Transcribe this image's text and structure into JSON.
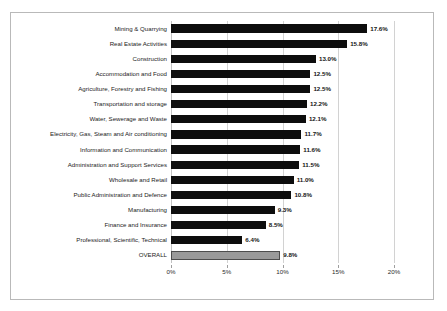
{
  "chart_data": {
    "type": "bar",
    "orientation": "horizontal",
    "title": "",
    "subtitle": "",
    "xlabel": "",
    "ylabel": "",
    "xlim": [
      0,
      20
    ],
    "xtick_labels": [
      "0%",
      "5%",
      "10%",
      "15%",
      "20%"
    ],
    "xticks": [
      0,
      5,
      10,
      15,
      20
    ],
    "grid": true,
    "legend": "none",
    "value_label_suffix": "%",
    "categories": [
      "Mining & Quarrying",
      "Real Estate Activities",
      "Construction",
      "Accommodation and Food",
      "Agriculture, Forestry and Fishing",
      "Transportation and storage",
      "Water, Sewerage and Waste",
      "Electricity, Gas, Steam and Air conditioning",
      "Information and Communication",
      "Administration and Support Services",
      "Wholesale and Retail",
      "Public Administration and Defence",
      "Manufacturing",
      "Finance and Insurance",
      "Professional, Scientific, Technical",
      "OVERALL"
    ],
    "values": [
      17.6,
      15.8,
      13.0,
      12.5,
      12.5,
      12.2,
      12.1,
      11.7,
      11.6,
      11.5,
      11.0,
      10.8,
      9.3,
      8.5,
      6.4,
      9.8
    ],
    "value_labels": [
      "17.6%",
      "15.8%",
      "13.0%",
      "12.5%",
      "12.5%",
      "12.2%",
      "12.1%",
      "11.7%",
      "11.6%",
      "11.5%",
      "11.0%",
      "10.8%",
      "9.3%",
      "8.5%",
      "6.4%",
      "9.8%"
    ],
    "bar_colors": [
      "#0d0d0d",
      "#0d0d0d",
      "#0d0d0d",
      "#0d0d0d",
      "#0d0d0d",
      "#0d0d0d",
      "#0d0d0d",
      "#0d0d0d",
      "#0d0d0d",
      "#0d0d0d",
      "#0d0d0d",
      "#0d0d0d",
      "#0d0d0d",
      "#0d0d0d",
      "#0d0d0d",
      "#9a9a9a"
    ],
    "highlight_category": "OVERALL",
    "highlight_color": "#9a9a9a",
    "series_color": "#0d0d0d",
    "gridline_color": "#d2d2d2",
    "border_color": "#b9b9b9"
  }
}
